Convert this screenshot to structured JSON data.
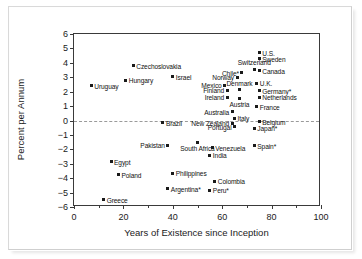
{
  "chart_data": {
    "type": "scatter",
    "title": "",
    "xlabel": "Years of Existence since Inception",
    "ylabel": "Percent per Annum",
    "xlim": [
      0,
      100
    ],
    "ylim": [
      -6,
      6
    ],
    "xticks": [
      0,
      20,
      40,
      60,
      80,
      100
    ],
    "xtick_labels": [
      "0",
      "20",
      "40",
      "60",
      "80",
      "100"
    ],
    "xminor_ticks": [
      10,
      30,
      50,
      70,
      90
    ],
    "yticks": [
      6,
      5,
      4,
      3,
      2,
      1,
      0,
      -1,
      -2,
      -3,
      -4,
      -5,
      -6
    ],
    "ytick_labels": [
      "6",
      "5",
      "4",
      "3",
      "2",
      "1",
      "0",
      "−1",
      "−2",
      "−3",
      "−4",
      "−5",
      "−6"
    ],
    "grid": false,
    "legend": "none",
    "annotations": [
      {
        "text": "zero reference line",
        "y": 0,
        "style": "dashed"
      }
    ],
    "points": [
      {
        "label": "Uruguay",
        "x": 7,
        "y": 2.4,
        "pos": "l"
      },
      {
        "label": "Czechoslovakia",
        "x": 24,
        "y": 3.8,
        "pos": "l"
      },
      {
        "label": "Hungary",
        "x": 21,
        "y": 2.8,
        "pos": "l"
      },
      {
        "label": "Israel",
        "x": 40,
        "y": 3.05,
        "pos": "l"
      },
      {
        "label": "U.S.",
        "x": 75,
        "y": 4.7,
        "pos": "l"
      },
      {
        "label": "Sweden",
        "x": 75,
        "y": 4.3,
        "pos": "l"
      },
      {
        "label": "Switzerland",
        "x": 73,
        "y": 3.55,
        "pos": "t"
      },
      {
        "label": "Canada",
        "x": 75,
        "y": 3.45,
        "pos": "l"
      },
      {
        "label": "Chile*",
        "x": 68,
        "y": 3.3,
        "pos": "r"
      },
      {
        "label": "Norway",
        "x": 66,
        "y": 3.0,
        "pos": "r"
      },
      {
        "label": "Mexico",
        "x": 61,
        "y": 2.45,
        "pos": "r"
      },
      {
        "label": "U.K.",
        "x": 74,
        "y": 2.6,
        "pos": "l"
      },
      {
        "label": "Denmark",
        "x": 67,
        "y": 2.15,
        "pos": "t"
      },
      {
        "label": "Finland",
        "x": 62,
        "y": 2.1,
        "pos": "r"
      },
      {
        "label": "Germany*",
        "x": 75,
        "y": 2.05,
        "pos": "l"
      },
      {
        "label": "Ireland",
        "x": 62,
        "y": 1.6,
        "pos": "r"
      },
      {
        "label": "Austria",
        "x": 67,
        "y": 1.55,
        "pos": "b"
      },
      {
        "label": "Netherlands",
        "x": 75,
        "y": 1.6,
        "pos": "l"
      },
      {
        "label": "France",
        "x": 74,
        "y": 0.95,
        "pos": "l"
      },
      {
        "label": "Australia",
        "x": 64,
        "y": 0.6,
        "pos": "r"
      },
      {
        "label": "Italy",
        "x": 65,
        "y": 0.15,
        "pos": "l"
      },
      {
        "label": "Belgium",
        "x": 75,
        "y": -0.1,
        "pos": "l"
      },
      {
        "label": "Brazil",
        "x": 36,
        "y": -0.15,
        "pos": "l"
      },
      {
        "label": "New Zealand",
        "x": 64,
        "y": -0.2,
        "pos": "r"
      },
      {
        "label": "Portugal",
        "x": 65,
        "y": -0.45,
        "pos": "r"
      },
      {
        "label": "Japan*",
        "x": 73,
        "y": -0.55,
        "pos": "l"
      },
      {
        "label": "South Africa",
        "x": 50,
        "y": -1.5,
        "pos": "b"
      },
      {
        "label": "Pakistan",
        "x": 38,
        "y": -1.7,
        "pos": "r"
      },
      {
        "label": "Spain*",
        "x": 73,
        "y": -1.75,
        "pos": "l"
      },
      {
        "label": "Venezuela",
        "x": 56,
        "y": -1.9,
        "pos": "l"
      },
      {
        "label": "India",
        "x": 55,
        "y": -2.4,
        "pos": "l"
      },
      {
        "label": "Egypt",
        "x": 15,
        "y": -2.85,
        "pos": "l"
      },
      {
        "label": "Poland",
        "x": 18,
        "y": -3.75,
        "pos": "l"
      },
      {
        "label": "Philippines",
        "x": 40,
        "y": -3.65,
        "pos": "l"
      },
      {
        "label": "Colombia",
        "x": 57,
        "y": -4.2,
        "pos": "l"
      },
      {
        "label": "Argentina*",
        "x": 38,
        "y": -4.75,
        "pos": "l"
      },
      {
        "label": "Peru*",
        "x": 55,
        "y": -4.85,
        "pos": "l"
      },
      {
        "label": "Greece",
        "x": 12,
        "y": -5.5,
        "pos": "l"
      }
    ]
  }
}
